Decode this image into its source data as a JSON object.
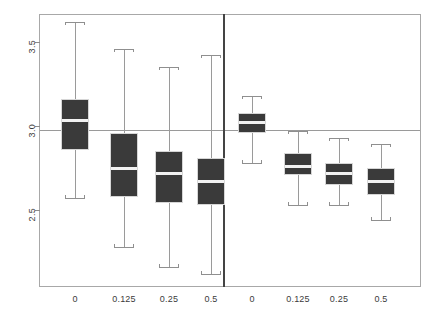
{
  "chart_data": {
    "type": "box",
    "title": "",
    "xlabel": "",
    "ylabel": "",
    "ylim": [
      2.05,
      3.7
    ],
    "yticks": [
      2.5,
      3.0,
      3.5
    ],
    "ytick_labels": [
      "2.5",
      "3.0",
      "3.5"
    ],
    "grid": false,
    "legend": "none",
    "reference_line": 3.0,
    "panels": [
      {
        "name": "left-panel",
        "categories": [
          "0",
          "0.125",
          "0.25",
          "0.5"
        ],
        "boxes": [
          {
            "label": "0",
            "whisker_low": 2.57,
            "q1": 2.86,
            "median": 3.03,
            "q3": 3.16,
            "whisker_high": 3.62
          },
          {
            "label": "0.125",
            "whisker_low": 2.28,
            "q1": 2.58,
            "median": 2.75,
            "q3": 2.96,
            "whisker_high": 3.46
          },
          {
            "label": "0.25",
            "whisker_low": 2.16,
            "q1": 2.54,
            "median": 2.72,
            "q3": 2.85,
            "whisker_high": 3.35
          },
          {
            "label": "0.5",
            "whisker_low": 2.12,
            "q1": 2.53,
            "median": 2.67,
            "q3": 2.81,
            "whisker_high": 3.42
          }
        ]
      },
      {
        "name": "right-panel",
        "categories": [
          "0",
          "0.125",
          "0.25",
          "0.5"
        ],
        "boxes": [
          {
            "label": "0",
            "whisker_low": 2.78,
            "q1": 2.96,
            "median": 3.02,
            "q3": 3.08,
            "whisker_high": 3.18
          },
          {
            "label": "0.125",
            "whisker_low": 2.53,
            "q1": 2.71,
            "median": 2.76,
            "q3": 2.84,
            "whisker_high": 2.97
          },
          {
            "label": "0.25",
            "whisker_low": 2.53,
            "q1": 2.65,
            "median": 2.72,
            "q3": 2.78,
            "whisker_high": 2.93
          },
          {
            "label": "0.5",
            "whisker_low": 2.44,
            "q1": 2.59,
            "median": 2.67,
            "q3": 2.75,
            "whisker_high": 2.89
          }
        ]
      }
    ],
    "colors": {
      "box_fill": "#3a3a3a",
      "median": "#f2f2f2",
      "whisker": "#9a9a9a",
      "frame": "#a8a8a8",
      "divider": "#444444",
      "reference_line": "#9a9a9a",
      "text": "#3b3b3b",
      "background": "#ffffff"
    },
    "geometry": {
      "plot_left": 40,
      "plot_right": 420,
      "plot_top": 14,
      "plot_bottom": 287,
      "divider_x": 224,
      "box_width": 28,
      "y_map": {
        "v1": 3.5,
        "py1": 42,
        "v2": 2.5,
        "py2": 210
      },
      "box_centers": [
        75,
        124,
        169,
        211,
        252,
        298,
        339,
        381
      ]
    }
  }
}
